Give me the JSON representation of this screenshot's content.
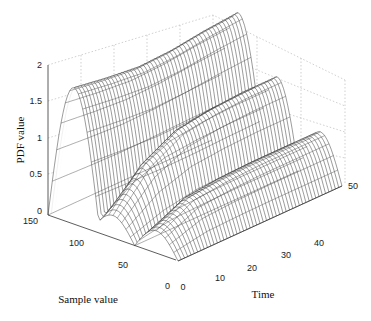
{
  "chart_data": {
    "type": "surface3d",
    "title": "",
    "xlabel": "Time",
    "ylabel": "Sample value",
    "zlabel": "PDF value",
    "x_ticks": [
      0,
      10,
      20,
      30,
      40,
      50
    ],
    "y_ticks": [
      0,
      50,
      100,
      150
    ],
    "z_ticks": [
      0,
      0.5,
      1,
      1.5,
      2
    ],
    "xlim": [
      0,
      50
    ],
    "ylim": [
      0,
      150
    ],
    "zlim": [
      0,
      2
    ],
    "grid": true,
    "style": "mesh wireframe, black lines on white",
    "series": [
      {
        "name": "ridge-high (sample ~120)",
        "peak_sample": 120,
        "width": 30,
        "values_over_time": [
          1.82,
          1.75,
          1.7,
          1.72,
          1.78,
          1.82
        ]
      },
      {
        "name": "ridge-mid (sample ~75)",
        "peak_sample": 75,
        "width": 25,
        "values_over_time": [
          0.3,
          0.8,
          1.05,
          1.12,
          1.15,
          1.15
        ]
      },
      {
        "name": "ridge-low (sample ~25)",
        "peak_sample": 25,
        "width": 25,
        "values_over_time": [
          0.3,
          0.55,
          0.6,
          0.62,
          0.62,
          0.62
        ]
      }
    ]
  },
  "axes": {
    "z_label": "PDF value",
    "y_label": "Sample value",
    "x_label": "Time",
    "z_ticks": [
      "0",
      "0.5",
      "1",
      "1.5",
      "2"
    ],
    "y_ticks": [
      "150",
      "100",
      "50",
      "0"
    ],
    "x_ticks": [
      "0",
      "10",
      "20",
      "30",
      "40",
      "50"
    ]
  }
}
